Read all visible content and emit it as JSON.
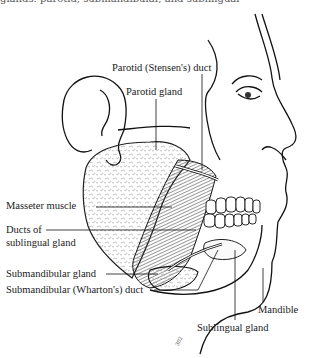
{
  "figure": {
    "top_cut_text": "glands: parotid, submandibular, and sublingual",
    "labels": {
      "parotid_duct": "Parotid (Stensen's) duct",
      "parotid_gland": "Parotid gland",
      "masseter": "Masseter muscle",
      "ducts_sublingual_1": "Ducts of",
      "ducts_sublingual_2": "sublingual gland",
      "submandibular_gland": "Submandibular gland",
      "submandibular_duct": "Submandibular (Wharton's) duct",
      "mandible": "Mandible",
      "sublingual_gland": "Sublingual gland"
    },
    "signature": "302"
  }
}
